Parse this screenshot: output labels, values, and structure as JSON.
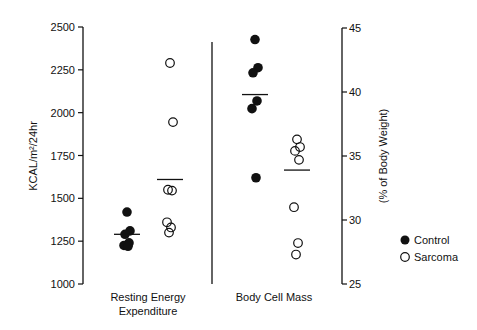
{
  "chart_data": {
    "type": "scatter",
    "title": "",
    "panels": [
      {
        "name": "Resting Energy Expenditure",
        "xlabel": "Resting Energy Expenditure",
        "ylabel": "KCAL/m²/24hr",
        "axis": "left",
        "ylim": [
          1000,
          2500
        ],
        "yticks": [
          1000,
          1250,
          1500,
          1750,
          2000,
          2250,
          2500
        ],
        "series": [
          {
            "name": "Control",
            "marker": "filled-circle",
            "values": [
              1420,
              1310,
              1290,
              1240,
              1225,
              1220
            ],
            "mean": 1290
          },
          {
            "name": "Sarcoma",
            "marker": "open-circle",
            "values": [
              2290,
              1945,
              1550,
              1545,
              1360,
              1330,
              1300
            ],
            "mean": 1610
          }
        ]
      },
      {
        "name": "Body Cell Mass",
        "xlabel": "Body Cell Mass",
        "ylabel": "(% of Body Weight)",
        "axis": "right",
        "ylim": [
          25,
          45
        ],
        "yticks": [
          25,
          30,
          35,
          40,
          45
        ],
        "series": [
          {
            "name": "Control",
            "marker": "filled-circle",
            "values": [
              44.1,
              41.9,
              41.5,
              39.3,
              38.7,
              33.3
            ],
            "mean": 39.8
          },
          {
            "name": "Sarcoma",
            "marker": "open-circle",
            "values": [
              36.3,
              35.7,
              35.4,
              34.7,
              31.0,
              28.2,
              27.3
            ],
            "mean": 33.9
          }
        ]
      }
    ],
    "legend": {
      "position": "right",
      "entries": [
        "Control",
        "Sarcoma"
      ]
    },
    "grid": false
  },
  "labels": {
    "left_ylabel": "KCAL/m²/24hr",
    "right_ylabel": "(% of Body Weight)",
    "x1_line1": "Resting Energy",
    "x1_line2": "Expenditure",
    "x2": "Body Cell Mass",
    "legend_control": "Control",
    "legend_sarcoma": "Sarcoma"
  }
}
